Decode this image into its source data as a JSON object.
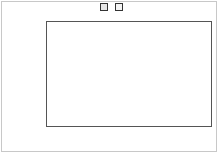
{
  "chart_data": {
    "type": "bar",
    "title": "",
    "xlabel": "",
    "ylabel": "PF",
    "categories": [
      "Head",
      "Middle",
      "Tail"
    ],
    "series": [
      {
        "name": "2012",
        "values": [
          1.0,
          0.84,
          0.8
        ],
        "color": "#e6e6e6",
        "pattern": "solid"
      },
      {
        "name": "2013",
        "values": [
          1.0,
          0.94,
          0.83
        ],
        "color": "#f4f4f4",
        "pattern": "dotted"
      }
    ],
    "ylim": [
      0,
      1.2
    ],
    "yticks": [
      "0,0",
      "0,2",
      "0,4",
      "0,6",
      "0,8",
      "1,0",
      "1,2"
    ],
    "grid": true,
    "legend_position": "top"
  },
  "legend": {
    "items": [
      "2012",
      "2013"
    ]
  },
  "axis": {
    "ylabel": "PF"
  }
}
